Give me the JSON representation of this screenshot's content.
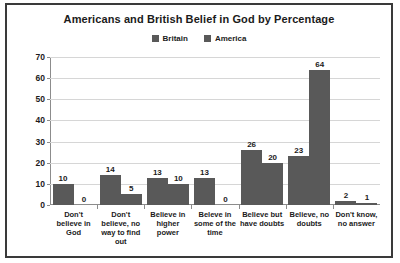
{
  "chart_data": {
    "type": "bar",
    "title": "Americans and British Belief in God by Percentage",
    "xlabel": "",
    "ylabel": "",
    "ylim": [
      0,
      70
    ],
    "ytick_step": 10,
    "yticks": [
      0,
      10,
      20,
      30,
      40,
      50,
      60,
      70
    ],
    "grid": true,
    "legend_position": "top-center",
    "bar_color": "#595959",
    "gridline_color": "#d6d6d6",
    "axis_color": "#8c8c8c",
    "border_color": "#3a3a3a",
    "text_color": "#1b1b1b",
    "categories": [
      "Don't believe in God",
      "Don't believe, no way to find out",
      "Believe in higher power",
      "Beleve in some of the time",
      "Believe but have doubts",
      "Believe, no doubts",
      "Don't know, no answer"
    ],
    "series": [
      {
        "name": "Britain",
        "values": [
          10,
          14,
          13,
          13,
          26,
          23,
          2
        ]
      },
      {
        "name": "America",
        "values": [
          0,
          5,
          10,
          0,
          20,
          64,
          1
        ]
      }
    ]
  }
}
